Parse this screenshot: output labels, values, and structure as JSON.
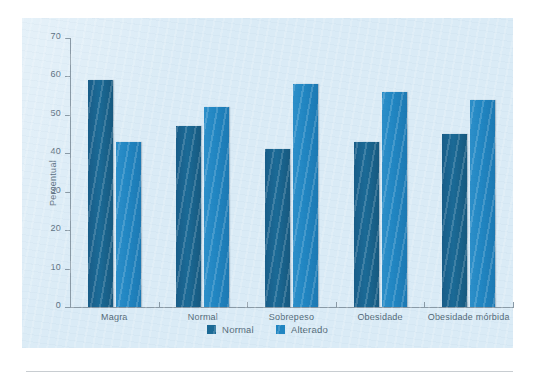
{
  "chart_data": {
    "type": "bar",
    "title": "",
    "xlabel": "",
    "ylabel": "Percentual",
    "ylim": [
      0,
      70
    ],
    "yticks": [
      0,
      10,
      20,
      30,
      40,
      50,
      60,
      70
    ],
    "grid": false,
    "legend_position": "bottom-center",
    "categories": [
      "Magra",
      "Normal",
      "Sobrepeso",
      "Obesidade",
      "Obesidade mórbida"
    ],
    "series": [
      {
        "name": "Normal",
        "color": "#1b6a96",
        "values": [
          59,
          47,
          41,
          43,
          45
        ]
      },
      {
        "name": "Alterado",
        "color": "#2186c2",
        "values": [
          43,
          52,
          58,
          56,
          54
        ]
      }
    ]
  },
  "legend": {
    "items": [
      {
        "label": "Normal",
        "color": "#1b6a96"
      },
      {
        "label": "Alterado",
        "color": "#2186c2"
      }
    ]
  },
  "colors": {
    "panel_background": "#d6e9f5",
    "page_background": "#ffffff",
    "axis": "#8a9aa6",
    "tick_text": "#5e7283",
    "series_normal": "#1b6a96",
    "series_alterado": "#2186c2",
    "rule": "#c8cdd1"
  }
}
